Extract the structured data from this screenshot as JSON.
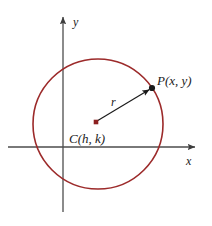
{
  "figure": {
    "type": "geometry-diagram",
    "background_color": "#ffffff",
    "width": 212,
    "height": 226
  },
  "labels": {
    "point_p": "P(x, y)",
    "center_c": "C(h, k)",
    "radius": "r",
    "axis_x": "x",
    "axis_y": "y"
  },
  "colors": {
    "circle_stroke": "#9c2a2a",
    "axis_stroke": "#4d4d4d",
    "point_fill": "#1a1a1a",
    "center_fill": "#8c1f1f",
    "text": "#1a1a1a",
    "radius_line": "#1a1a1a"
  },
  "geometry": {
    "circle": {
      "center_x": 98,
      "center_y": 124,
      "radius": 65
    },
    "center_point": {
      "x": 96,
      "y": 122
    },
    "point_p": {
      "x": 152,
      "y": 88
    },
    "x_axis": {
      "y": 147,
      "x_start": 8,
      "x_end": 197
    },
    "y_axis": {
      "x": 63,
      "y_start": 15,
      "y_end": 212
    },
    "radius_segment": {
      "x1": 96,
      "y1": 122,
      "x2": 152,
      "y2": 88
    }
  },
  "label_positions": {
    "point_p": {
      "x": 157,
      "y": 85
    },
    "center_c": {
      "x": 69,
      "y": 143
    },
    "radius": {
      "x": 111,
      "y": 106
    },
    "axis_x": {
      "x": 186,
      "y": 165
    },
    "axis_y": {
      "x": 73,
      "y": 26
    }
  }
}
